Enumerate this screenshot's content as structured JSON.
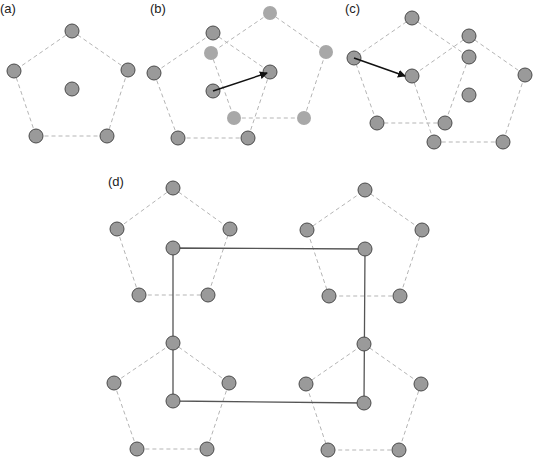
{
  "panels": {
    "a": {
      "label": "(a)",
      "label_pos": [
        0,
        13
      ],
      "pentagons": [
        {
          "style": "dark",
          "vertices": [
            [
              72,
              31
            ],
            [
              128,
              70
            ],
            [
              107,
              136
            ],
            [
              36,
              136
            ],
            [
              14,
              71
            ]
          ],
          "center": [
            72,
            89
          ]
        }
      ]
    },
    "b": {
      "label": "(b)",
      "label_pos": [
        150,
        13
      ],
      "pentagons": [
        {
          "style": "dark",
          "vertices": [
            [
              213,
              33
            ],
            [
              270,
              72
            ],
            [
              248,
              138
            ],
            [
              178,
              138
            ],
            [
              154,
              73
            ]
          ],
          "center": [
            213,
            91
          ]
        },
        {
          "style": "light",
          "vertices": [
            [
              270,
              13
            ],
            [
              326,
              52
            ],
            [
              304,
              118
            ],
            [
              234,
              118
            ],
            [
              211,
              53
            ]
          ],
          "center": null
        }
      ],
      "arrow": {
        "from": [
          213,
          91
        ],
        "to": [
          267,
          73
        ]
      }
    },
    "c": {
      "label": "(c)",
      "label_pos": [
        345,
        13
      ],
      "pentagons": [
        {
          "style": "dark",
          "vertices": [
            [
              412,
              18
            ],
            [
              469,
              57
            ],
            [
              445,
              123
            ],
            [
              377,
              123
            ],
            [
              354,
              58
            ]
          ],
          "center": null
        },
        {
          "style": "dark",
          "vertices": [
            [
              469,
              36
            ],
            [
              525,
              75
            ],
            [
              503,
              142
            ],
            [
              434,
              142
            ],
            [
              412,
              76
            ]
          ],
          "center": [
            469,
            95
          ]
        }
      ],
      "arrow": {
        "from": [
          354,
          58
        ],
        "to": [
          405,
          76
        ]
      }
    },
    "d": {
      "label": "(d)",
      "label_pos": [
        108,
        186
      ],
      "pentagons": [
        {
          "style": "dark",
          "vertices": [
            [
              173,
              188
            ],
            [
              230,
              229
            ],
            [
              208,
              295
            ],
            [
              139,
              295
            ],
            [
              117,
              229
            ]
          ],
          "center": [
            173,
            248
          ]
        },
        {
          "style": "dark",
          "vertices": [
            [
              365,
              190
            ],
            [
              422,
              230
            ],
            [
              400,
              296
            ],
            [
              329,
              296
            ],
            [
              307,
              230
            ]
          ],
          "center": [
            365,
            249
          ]
        },
        {
          "style": "dark",
          "vertices": [
            [
              173,
              343
            ],
            [
              229,
              383
            ],
            [
              207,
              449
            ],
            [
              137,
              449
            ],
            [
              114,
              383
            ]
          ],
          "center": [
            173,
            401
          ]
        },
        {
          "style": "dark",
          "vertices": [
            [
              364,
              344
            ],
            [
              421,
              384
            ],
            [
              399,
              450
            ],
            [
              328,
              450
            ],
            [
              306,
              384
            ]
          ],
          "center": [
            364,
            403
          ]
        }
      ],
      "rectangle": [
        [
          173,
          248
        ],
        [
          365,
          249
        ],
        [
          364,
          403
        ],
        [
          173,
          401
        ]
      ]
    }
  },
  "colors": {
    "node_fill_dark": "#9a9a9a",
    "node_stroke_dark": "#4a4a4a",
    "node_fill_light": "#a8a8a8",
    "dashed_edge": "#b5b5b5",
    "arrow": "#111111",
    "rect_line": "#555555"
  }
}
